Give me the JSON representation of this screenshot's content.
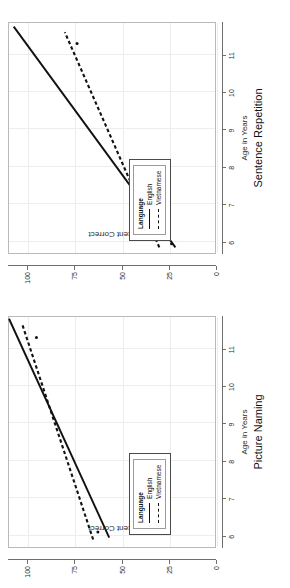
{
  "figure": {
    "background_color": "#ffffff",
    "grid_color": "#ededed",
    "axis_color": "#6e6e6e",
    "line_color": "#111111",
    "orientation_note": "rotated-90-ccw"
  },
  "panels": [
    {
      "id": "sentence-repetition",
      "title": "Sentence Repetition",
      "xlabel": "Age in Years",
      "ylabel": "Percent Correct",
      "legend": {
        "title": "Language",
        "items": [
          {
            "label": "English",
            "style": "solid"
          },
          {
            "label": "Vietnamese",
            "style": "dashed"
          }
        ]
      }
    },
    {
      "id": "picture-naming",
      "title": "Picture Naming",
      "xlabel": "Age in Years",
      "ylabel": "Percent Correct",
      "legend": {
        "title": "Language",
        "items": [
          {
            "label": "English",
            "style": "solid"
          },
          {
            "label": "Vietnamese",
            "style": "dashed"
          }
        ]
      }
    }
  ],
  "chart_data": [
    {
      "type": "line",
      "title": "Sentence Repetition",
      "xlabel": "Age in Years",
      "ylabel": "Percent Correct",
      "xlim": [
        5.7,
        11.9
      ],
      "ylim": [
        0,
        110
      ],
      "xticks": [
        6,
        7,
        8,
        9,
        10,
        11
      ],
      "xticklabels": [
        "6",
        "7",
        "8",
        "9",
        "10",
        "11"
      ],
      "yticks": [
        0,
        25,
        50,
        75,
        100
      ],
      "yticklabels": [
        "0",
        "25",
        "50",
        "75",
        "100"
      ],
      "grid": true,
      "legend": "inside-lower-left",
      "legend_title": "Language",
      "series": [
        {
          "name": "English",
          "style": "solid",
          "x": [
            5.85,
            11.75
          ],
          "y": [
            22.0,
            107.5
          ]
        },
        {
          "name": "Vietnamese",
          "style": "dashed",
          "x": [
            5.85,
            11.6
          ],
          "y": [
            30.5,
            80.5
          ]
        }
      ],
      "points": [
        {
          "x": 11.3,
          "y": 74.0,
          "marker": "dot"
        },
        {
          "x": 5.95,
          "y": 24.0,
          "marker": "dot"
        }
      ]
    },
    {
      "type": "line",
      "title": "Picture Naming",
      "xlabel": "Age in Years",
      "ylabel": "Percent Correct",
      "xlim": [
        5.7,
        11.9
      ],
      "ylim": [
        0,
        110
      ],
      "xticks": [
        6,
        7,
        8,
        9,
        10,
        11
      ],
      "xticklabels": [
        "6",
        "7",
        "8",
        "9",
        "10",
        "11"
      ],
      "yticks": [
        0,
        25,
        50,
        75,
        100
      ],
      "yticklabels": [
        "0",
        "25",
        "50",
        "75",
        "100"
      ],
      "grid": true,
      "legend": "inside-lower-left",
      "legend_title": "Language",
      "series": [
        {
          "name": "English",
          "style": "solid",
          "x": [
            5.95,
            11.8
          ],
          "y": [
            57.0,
            110.0
          ]
        },
        {
          "name": "Vietnamese",
          "style": "dashed",
          "x": [
            5.9,
            11.65
          ],
          "y": [
            65.5,
            103.0
          ]
        }
      ],
      "points": [
        {
          "x": 11.3,
          "y": 95.5,
          "marker": "dot"
        },
        {
          "x": 6.1,
          "y": 63.0,
          "marker": "dot"
        }
      ]
    }
  ]
}
